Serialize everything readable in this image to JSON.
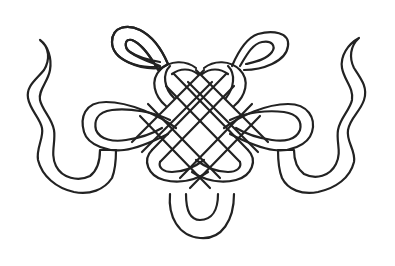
{
  "illustration": {
    "subject": "endless knot line art with ribbon tails",
    "colors": {
      "background": "#ffffff",
      "stroke": "#222222"
    },
    "elements": [
      "left-ribbon-tail",
      "right-ribbon-tail",
      "top-left-loop",
      "top-right-loop",
      "left-side-loop",
      "right-side-loop",
      "center-lattice",
      "bottom-loop"
    ]
  }
}
